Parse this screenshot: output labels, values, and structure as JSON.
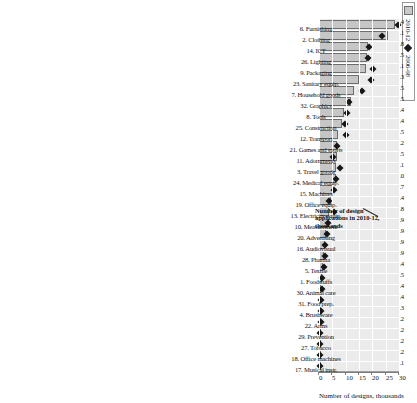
{
  "legend": {
    "series_bar": "2010-12",
    "series_marker": "2006-08"
  },
  "axis": {
    "title": "Number of designs, thousands",
    "ticks": [
      "0",
      "5",
      "10",
      "15",
      "20",
      "25",
      "30"
    ]
  },
  "annotation": {
    "text": "Number of design applications in 2010-12, thousands"
  },
  "chart_data": {
    "type": "bar",
    "title": "",
    "xlabel": "",
    "ylabel": "Number of designs, thousands",
    "ylim": [
      0,
      30
    ],
    "grid": true,
    "orientation": "vertical-rotated",
    "legend_position": "top-left",
    "categories": [
      "6. Furnishing",
      "2. Clothing",
      "14. ICT",
      "26. Lighting",
      "9. Packaging",
      "23. Sanitary equip.",
      "7. Household goods",
      "32. Graphics",
      "8. Tools",
      "25. Construction",
      "12. Transport",
      "21. Games and sports",
      "11. Adornments",
      "3. Travel goods",
      "24. Medical equip.",
      "15. Machines",
      "19. Office equip.",
      "13. Electricity equip.",
      "10. Measurement",
      "20. Advertising",
      "16. Audiovisual",
      "28. Pharma",
      "5. Textile",
      "1. Foodstuffs",
      "30. Animal care",
      "31. Food prep.",
      "4. Brushware",
      "22. Arms",
      "29. Prevention",
      "27. Tobacco",
      "18. Office machines",
      "17. Musical instr."
    ],
    "data_labels": [
      "5.4",
      "3.1",
      "4.8",
      "3.5",
      "5.1",
      "3.3",
      "3.5",
      "2.5",
      "3.4",
      "2.4",
      "3.5",
      "2.2",
      "1.5",
      "2.1",
      "2.0",
      "1.7",
      "1.4",
      "1.8",
      "1.9",
      "0.9",
      "0.9",
      "0.9",
      "0.4",
      "0.5",
      "0.4",
      "0.4",
      "0.3",
      "0.2",
      "0.2",
      "0.2",
      "0.2",
      "0.1"
    ],
    "series": [
      {
        "name": "2010-12",
        "type": "bar",
        "values": [
          28.5,
          26.0,
          18.5,
          18.0,
          17.8,
          15.0,
          13.2,
          12.0,
          9.5,
          8.6,
          7.2,
          6.8,
          6.6,
          6.4,
          6.2,
          5.1,
          4.4,
          3.9,
          3.6,
          2.6,
          2.3,
          2.0,
          1.5,
          1.1,
          0.9,
          0.8,
          0.6,
          0.5,
          0.4,
          0.3,
          0.25,
          0.2
        ]
      },
      {
        "name": "2006-08",
        "type": "scatter",
        "values": [
          29.6,
          23.7,
          18.9,
          18.2,
          20.1,
          19.4,
          16.0,
          11.3,
          10.5,
          9.7,
          10.2,
          6.6,
          5.2,
          8.0,
          6.4,
          5.5,
          3.9,
          5.6,
          3.4,
          2.9,
          2.4,
          2.1,
          1.7,
          1.3,
          1.0,
          0.9,
          0.7,
          0.6,
          0.45,
          0.35,
          0.3,
          0.25
        ]
      }
    ]
  }
}
